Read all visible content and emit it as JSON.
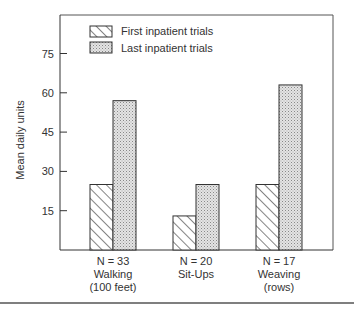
{
  "chart_data": {
    "type": "bar",
    "title": "",
    "xlabel": "",
    "ylabel": "Mean daily units",
    "ylim": [
      0,
      90
    ],
    "yticks": [
      15,
      30,
      45,
      60,
      75
    ],
    "grid": false,
    "legend_position": "top-left",
    "categories": [
      {
        "n_label": "N = 33",
        "name": "Walking",
        "unit": "(100 feet)"
      },
      {
        "n_label": "N = 20",
        "name": "Sit-Ups",
        "unit": ""
      },
      {
        "n_label": "N = 17",
        "name": "Weaving",
        "unit": "(rows)"
      }
    ],
    "series": [
      {
        "name": "First inpatient trials",
        "pattern": "hatched",
        "values": [
          25,
          13,
          25
        ]
      },
      {
        "name": "Last inpatient trials",
        "pattern": "stippled",
        "values": [
          57,
          25,
          63
        ]
      }
    ]
  },
  "colors": {
    "axis": "#333333",
    "stipple_fill": "#d8d8d8",
    "hatch_line": "#333333"
  }
}
